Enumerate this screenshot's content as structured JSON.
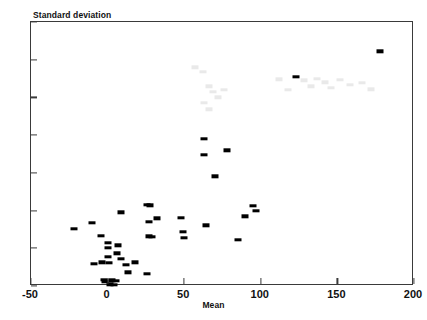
{
  "chart_data": {
    "type": "scatter",
    "title": "",
    "ylabel": "Standard deviation",
    "xlabel": "Mean",
    "xlim": [
      -50,
      200
    ],
    "ylim": [
      0,
      70
    ],
    "xticks": [
      -50,
      0,
      50,
      100,
      150,
      200
    ],
    "yticks": [
      0,
      10,
      20,
      30,
      40,
      50,
      60,
      70
    ],
    "xtick_labels": [
      "-50",
      "0",
      "50",
      "100",
      "150",
      "200"
    ],
    "ytick_labels": [
      "0",
      "10",
      "20",
      "30",
      "40",
      "50",
      "60",
      "70"
    ],
    "grid": false,
    "legend": null,
    "marker": "filled-rectangle",
    "marker_color": "#000000",
    "points": [
      {
        "x": -22,
        "y": 15.2
      },
      {
        "x": -10,
        "y": 16.7
      },
      {
        "x": -9,
        "y": 5.9
      },
      {
        "x": -4,
        "y": 13.3
      },
      {
        "x": -3.5,
        "y": 6.3
      },
      {
        "x": -2.5,
        "y": 1.6
      },
      {
        "x": -1.5,
        "y": 1.2
      },
      {
        "x": 0,
        "y": 11.4
      },
      {
        "x": 0,
        "y": 10.1
      },
      {
        "x": 0.5,
        "y": 7.8
      },
      {
        "x": 1,
        "y": 6.2
      },
      {
        "x": 1.5,
        "y": 0.4
      },
      {
        "x": 3,
        "y": 1.5
      },
      {
        "x": 4,
        "y": 0.3
      },
      {
        "x": 5.5,
        "y": 1.4
      },
      {
        "x": 6,
        "y": 8.7
      },
      {
        "x": 7,
        "y": 10.8
      },
      {
        "x": 8.5,
        "y": 19.5
      },
      {
        "x": 9,
        "y": 7.2
      },
      {
        "x": 12,
        "y": 5.6
      },
      {
        "x": 13,
        "y": 3.6
      },
      {
        "x": 18,
        "y": 6.3
      },
      {
        "x": 26,
        "y": 3.3
      },
      {
        "x": 26,
        "y": 21.6
      },
      {
        "x": 27.5,
        "y": 21.4
      },
      {
        "x": 27,
        "y": 17.0
      },
      {
        "x": 27,
        "y": 13.2
      },
      {
        "x": 29,
        "y": 13.1
      },
      {
        "x": 32,
        "y": 17.9
      },
      {
        "x": 48,
        "y": 18.1
      },
      {
        "x": 49,
        "y": 14.3
      },
      {
        "x": 50,
        "y": 12.7
      },
      {
        "x": 63,
        "y": 39.1
      },
      {
        "x": 63,
        "y": 34.8
      },
      {
        "x": 64,
        "y": 16.1
      },
      {
        "x": 70,
        "y": 29.1
      },
      {
        "x": 78,
        "y": 36.0
      },
      {
        "x": 85,
        "y": 12.2
      },
      {
        "x": 90,
        "y": 18.5
      },
      {
        "x": 95,
        "y": 21.2
      },
      {
        "x": 97,
        "y": 20.0
      },
      {
        "x": 123,
        "y": 55.4
      },
      {
        "x": 178,
        "y": 62.2
      }
    ],
    "faint_artifacts": [
      {
        "x": 57,
        "y": 58.0
      },
      {
        "x": 62,
        "y": 56.8
      },
      {
        "x": 66,
        "y": 53.0
      },
      {
        "x": 69,
        "y": 51.5
      },
      {
        "x": 72,
        "y": 50.0
      },
      {
        "x": 63,
        "y": 48.5
      },
      {
        "x": 66,
        "y": 46.8
      },
      {
        "x": 76,
        "y": 52.0
      },
      {
        "x": 112,
        "y": 54.8
      },
      {
        "x": 118,
        "y": 52.0
      },
      {
        "x": 128,
        "y": 54.5
      },
      {
        "x": 133,
        "y": 53.0
      },
      {
        "x": 137,
        "y": 55.0
      },
      {
        "x": 142,
        "y": 54.0
      },
      {
        "x": 146,
        "y": 52.5
      },
      {
        "x": 152,
        "y": 54.6
      },
      {
        "x": 158,
        "y": 53.4
      },
      {
        "x": 166,
        "y": 53.8
      },
      {
        "x": 172,
        "y": 52.2
      }
    ]
  }
}
